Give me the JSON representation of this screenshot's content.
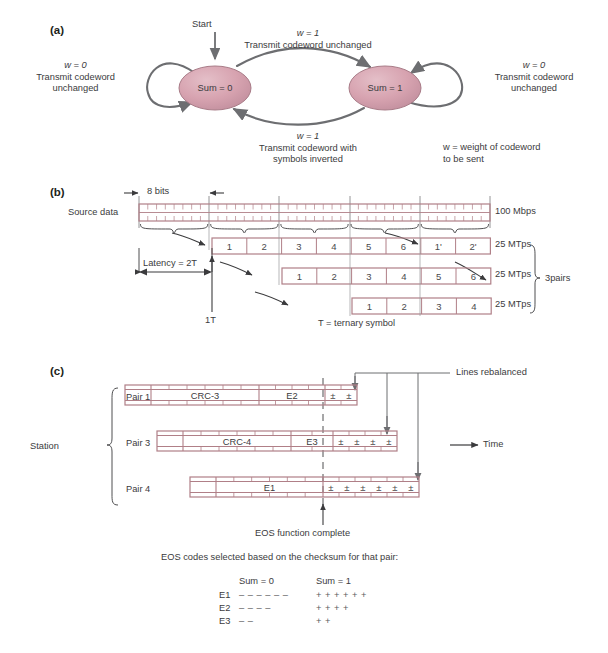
{
  "figure": {
    "panels": [
      {
        "id": "a",
        "label": "(a)"
      },
      {
        "id": "b",
        "label": "(b)"
      },
      {
        "id": "c",
        "label": "(c)"
      }
    ]
  },
  "panel_a": {
    "label": "(a)",
    "start_label": "Start",
    "state_left": "Sum = 0",
    "state_right": "Sum = 1",
    "top_transition": {
      "condition": "w = 1",
      "action": "Transmit codeword unchanged"
    },
    "bottom_transition": {
      "condition": "w = 1",
      "action_line1": "Transmit codeword with",
      "action_line2": "symbols inverted"
    },
    "left_loop": {
      "condition": "w = 0",
      "action_line1": "Transmit codeword",
      "action_line2": "unchanged"
    },
    "right_loop": {
      "condition": "w = 0",
      "action_line1": "Transmit codeword",
      "action_line2": "unchanged"
    },
    "note_line1": "w = weight of codeword",
    "note_line2": "to be sent",
    "colors": {
      "state_fill": "#d9a8b4",
      "state_stroke": "#9a6b78",
      "arrow": "#6d6e71"
    }
  },
  "panel_b": {
    "label": "(b)",
    "source_label": "Source data",
    "bits_label": "8 bits",
    "latency_label": "Latency = 2T",
    "tick_label": "1T",
    "ternary_note": "T = ternary symbol",
    "rate_source": "100 Mbps",
    "rates": [
      "25 MTps",
      "25 MTps",
      "25 MTps"
    ],
    "pairs_label": "3pairs",
    "rows": [
      {
        "cells": [
          "1",
          "2",
          "3",
          "4",
          "5",
          "6",
          "1'",
          "2'"
        ]
      },
      {
        "cells": [
          "1",
          "2",
          "3",
          "4",
          "5",
          "6"
        ]
      },
      {
        "cells": [
          "1",
          "2",
          "3",
          "4"
        ]
      }
    ],
    "source_groups": 5,
    "ticks_per_group": 8,
    "colors": {
      "bar_stroke": "#b07f87",
      "grid": "#7a7a7c"
    }
  },
  "panel_c": {
    "label": "(c)",
    "station_label": "Station",
    "pair_labels": [
      "Pair 1",
      "Pair 3",
      "Pair 4"
    ],
    "time_label": "Time",
    "lines_rebalanced_label": "Lines rebalanced",
    "eos_complete_label": "EOS function complete",
    "bars": [
      {
        "name": "Pair 1",
        "blocks": [
          "CRC-3",
          "E2"
        ],
        "symbols": [
          "±",
          "±"
        ]
      },
      {
        "name": "Pair 3",
        "blocks": [
          "CRC-4",
          "E3"
        ],
        "symbols": [
          "±",
          "±",
          "±",
          "±"
        ]
      },
      {
        "name": "Pair 4",
        "blocks": [
          "E1"
        ],
        "symbols": [
          "±",
          "±",
          "±",
          "±",
          "±",
          "±"
        ]
      }
    ],
    "colors": {
      "bar_stroke": "#b07f87",
      "leader": "#6d6e71"
    }
  },
  "legend": {
    "caption": "EOS codes selected based on the checksum for that pair:",
    "col_headers": [
      "Sum = 0",
      "Sum = 1"
    ],
    "rows": [
      {
        "name": "E1",
        "sum0": "– – – – – –",
        "sum1": "+ + + + + +"
      },
      {
        "name": "E2",
        "sum0": "– – – –",
        "sum1": "+ + + +"
      },
      {
        "name": "E3",
        "sum0": "– –",
        "sum1": "+ +"
      }
    ]
  }
}
